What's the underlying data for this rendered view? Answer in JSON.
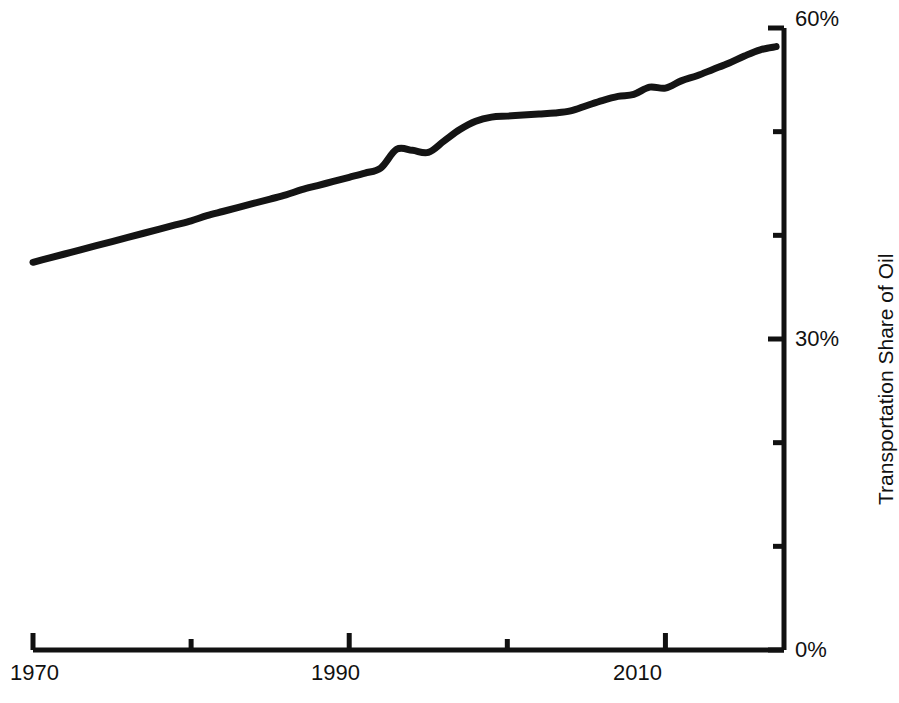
{
  "chart_data": {
    "type": "line",
    "title": "",
    "xlabel": "",
    "ylabel": "Transportation Share of Oil",
    "xlim": [
      1970,
      2017.5
    ],
    "ylim": [
      0,
      60
    ],
    "grid": false,
    "legend": "none",
    "x_ticks_major": [
      1970,
      1990,
      2010
    ],
    "x_tick_labels": [
      "1970",
      "1990",
      "2010"
    ],
    "x_ticks_minor": [
      1980,
      2000
    ],
    "y_ticks_major": [
      0,
      30,
      60
    ],
    "y_tick_labels": [
      "0%",
      "30%",
      "60%"
    ],
    "y_ticks_minor": [
      10,
      20,
      40,
      50
    ],
    "series": [
      {
        "name": "Transportation Share of Oil",
        "color": "#141414",
        "line_width": 7,
        "x": [
          1970,
          1971,
          1972,
          1973,
          1974,
          1975,
          1976,
          1977,
          1978,
          1979,
          1980,
          1981,
          1982,
          1983,
          1984,
          1985,
          1986,
          1987,
          1988,
          1989,
          1990,
          1991,
          1992,
          1993,
          1994,
          1995,
          1996,
          1997,
          1998,
          1999,
          2000,
          2001,
          2002,
          2003,
          2004,
          2005,
          2006,
          2007,
          2008,
          2009,
          2010,
          2011,
          2012,
          2013,
          2014,
          2015,
          2016,
          2017
        ],
        "y": [
          37.4,
          37.8,
          38.2,
          38.6,
          39.0,
          39.4,
          39.8,
          40.2,
          40.6,
          41.0,
          41.4,
          41.9,
          42.3,
          42.7,
          43.1,
          43.5,
          43.9,
          44.4,
          44.8,
          45.2,
          45.6,
          46.0,
          46.5,
          48.3,
          48.2,
          48.0,
          49.1,
          50.2,
          51.0,
          51.4,
          51.5,
          51.6,
          51.7,
          51.8,
          52.0,
          52.5,
          53.0,
          53.4,
          53.6,
          54.3,
          54.2,
          54.9,
          55.4,
          56.0,
          56.6,
          57.3,
          57.9,
          58.2
        ]
      }
    ],
    "annotations": {
      "start_value_percent": "37.4%",
      "end_value_percent": "58.2%",
      "start_year": "1970",
      "end_year": "2017"
    }
  },
  "axes": {
    "y_title": "Transportation Share of Oil",
    "y_labels": [
      {
        "text": "60%",
        "value": 60
      },
      {
        "text": "30%",
        "value": 30
      },
      {
        "text": "0%",
        "value": 0
      }
    ],
    "x_labels": [
      {
        "text": "1970",
        "value": 1970
      },
      {
        "text": "1990",
        "value": 1990
      },
      {
        "text": "2010",
        "value": 2010
      }
    ]
  },
  "style": {
    "axis_color": "#111111",
    "line_color": "#141414",
    "background": "#ffffff"
  }
}
